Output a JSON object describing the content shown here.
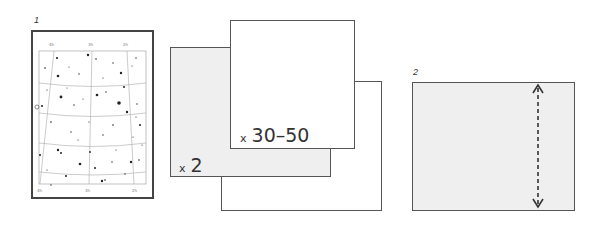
{
  "figure": {
    "panel1": {
      "number": "1",
      "star_chart": {
        "description": "star map with curved grid lines",
        "tick_labels_top": [
          "4h",
          "3h",
          "2h"
        ],
        "tick_labels_bottom": [
          "4h",
          "3h",
          "2h"
        ]
      },
      "cards": {
        "front_multiplier_prefix": "x",
        "front_multiplier_value": "30–50",
        "mid_multiplier_prefix": "x",
        "mid_multiplier_value": "2"
      }
    },
    "panel2": {
      "number": "2",
      "arrow": "double-headed dashed vertical arrow"
    },
    "colors": {
      "border": "#555555",
      "grey_fill": "#efefef",
      "white_fill": "#ffffff"
    }
  }
}
